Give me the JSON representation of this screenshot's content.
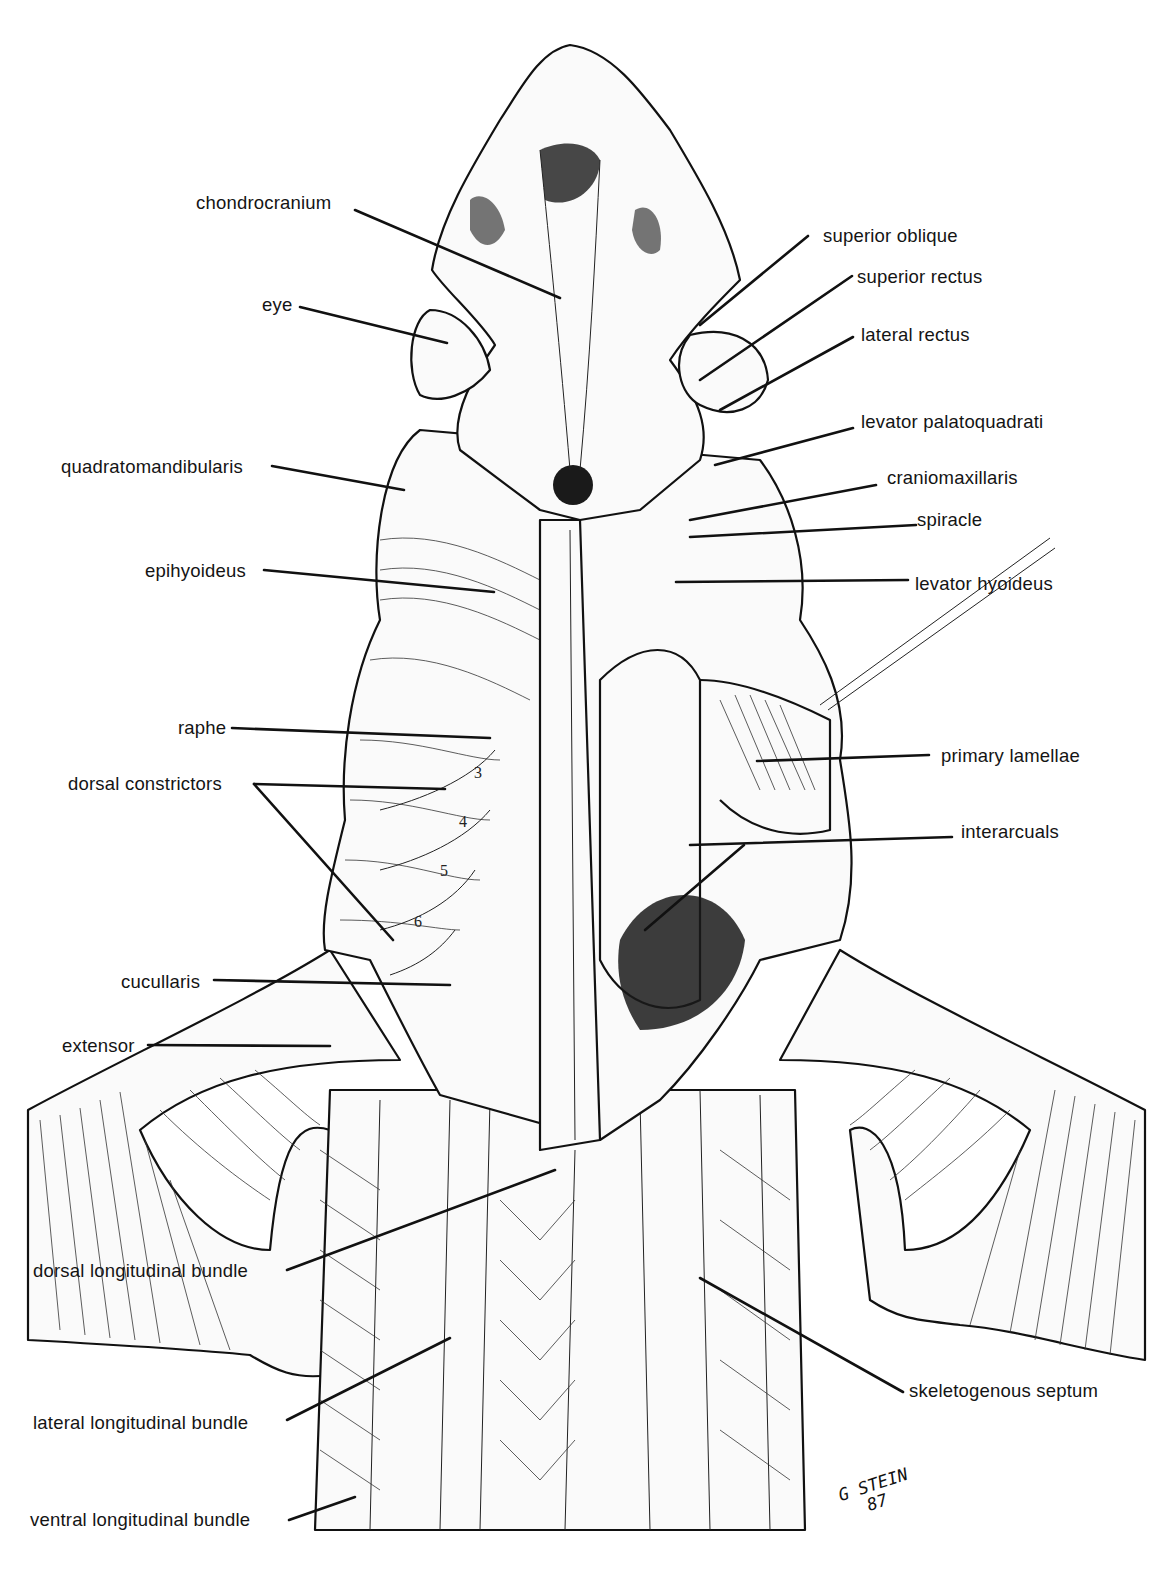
{
  "figure": {
    "labels_left": [
      {
        "id": "chondrocranium",
        "text": "chondrocranium"
      },
      {
        "id": "eye",
        "text": "eye"
      },
      {
        "id": "quadratomandibularis",
        "text": "quadratomandibularis"
      },
      {
        "id": "epihyoideus",
        "text": "epihyoideus"
      },
      {
        "id": "raphe",
        "text": "raphe"
      },
      {
        "id": "dorsal-constrictors",
        "text": "dorsal constrictors"
      },
      {
        "id": "cucullaris",
        "text": "cucullaris"
      },
      {
        "id": "extensor",
        "text": "extensor"
      },
      {
        "id": "dorsal-longitudinal-bundle",
        "text": "dorsal longitudinal bundle"
      },
      {
        "id": "lateral-longitudinal-bundle",
        "text": "lateral longitudinal bundle"
      },
      {
        "id": "ventral-longitudinal-bundle",
        "text": "ventral longitudinal bundle"
      }
    ],
    "labels_right": [
      {
        "id": "superior-oblique",
        "text": "superior oblique"
      },
      {
        "id": "superior-rectus",
        "text": "superior rectus"
      },
      {
        "id": "lateral-rectus",
        "text": "lateral rectus"
      },
      {
        "id": "levator-palatoquadrati",
        "text": "levator palatoquadrati"
      },
      {
        "id": "craniomaxillaris",
        "text": "craniomaxillaris"
      },
      {
        "id": "spiracle",
        "text": "spiracle"
      },
      {
        "id": "levator-hyoideus",
        "text": "levator hyoideus"
      },
      {
        "id": "primary-lamellae",
        "text": "primary lamellae"
      },
      {
        "id": "interarcuals",
        "text": "interarcuals"
      },
      {
        "id": "skeletogenous-septum",
        "text": "skeletogenous septum"
      }
    ],
    "constrictor_numbers": [
      "3",
      "4",
      "5",
      "6"
    ],
    "signature": {
      "line1": "G STEIN",
      "line2": "87"
    }
  }
}
